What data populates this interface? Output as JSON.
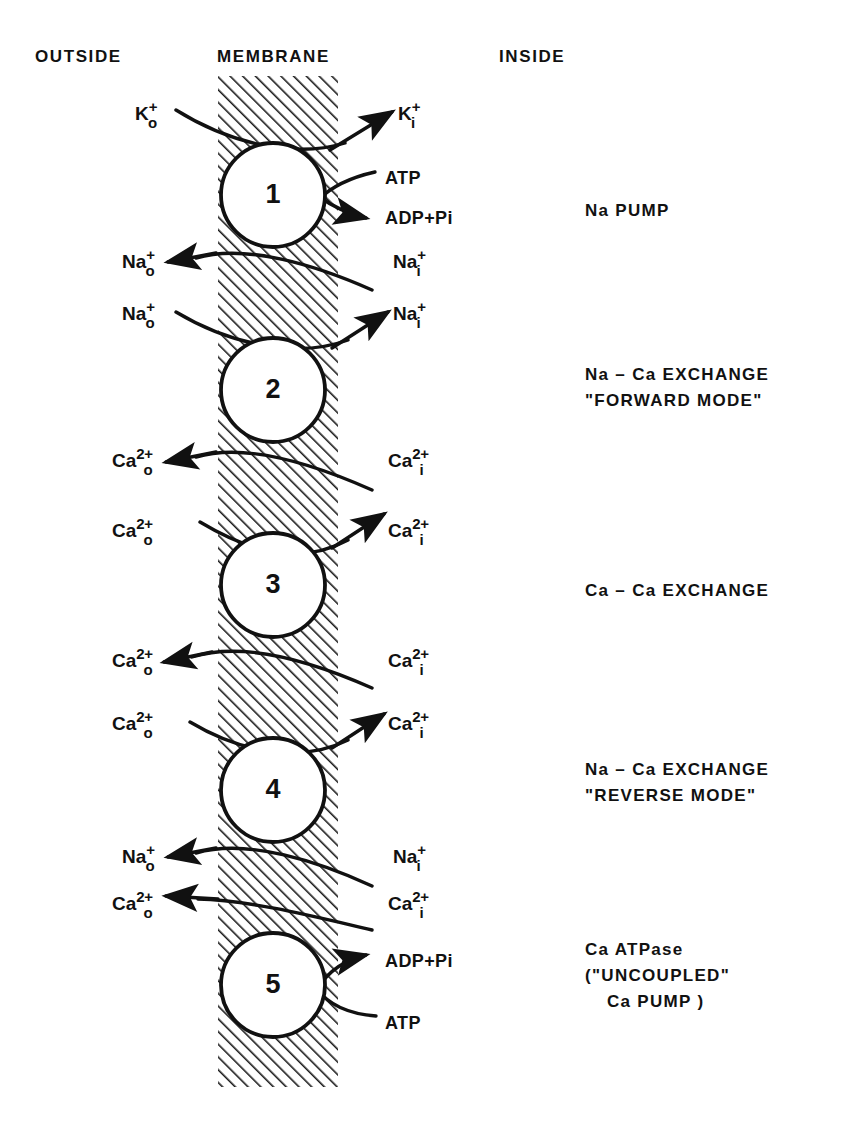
{
  "diagram": {
    "columns": {
      "outside": "OUTSIDE",
      "membrane": "MEMBRANE",
      "inside": "INSIDE"
    },
    "colors": {
      "ink": "#111111",
      "background": "#ffffff",
      "hatch": "#1a1a1a"
    },
    "membrane_band": {
      "x": 218,
      "width": 120,
      "y": 76,
      "height": 1011
    }
  },
  "systems": [
    {
      "number": "1",
      "name_lines": [
        "Na  PUMP"
      ],
      "outside_labels": [
        {
          "base": "K",
          "charge": "+",
          "location": "o"
        },
        {
          "base": "Na",
          "charge": "+",
          "location": "o"
        }
      ],
      "inside_labels": [
        {
          "base": "K",
          "charge": "+",
          "location": "i"
        },
        {
          "base": "Na",
          "charge": "+",
          "location": "i"
        }
      ],
      "molecules": [
        "ATP",
        "ADP+Pi"
      ]
    },
    {
      "number": "2",
      "name_lines": [
        "Na – Ca EXCHANGE",
        "\"FORWARD MODE\""
      ],
      "outside_labels": [
        {
          "base": "Na",
          "charge": "+",
          "location": "o"
        },
        {
          "base": "Ca",
          "charge": "2+",
          "location": "o"
        }
      ],
      "inside_labels": [
        {
          "base": "Na",
          "charge": "+",
          "location": "i"
        },
        {
          "base": "Ca",
          "charge": "2+",
          "location": "i"
        }
      ],
      "molecules": []
    },
    {
      "number": "3",
      "name_lines": [
        "Ca – Ca EXCHANGE"
      ],
      "outside_labels": [
        {
          "base": "Ca",
          "charge": "2+",
          "location": "o"
        },
        {
          "base": "Ca",
          "charge": "2+",
          "location": "o"
        }
      ],
      "inside_labels": [
        {
          "base": "Ca",
          "charge": "2+",
          "location": "i"
        },
        {
          "base": "Ca",
          "charge": "2+",
          "location": "i"
        }
      ],
      "molecules": []
    },
    {
      "number": "4",
      "name_lines": [
        "Na – Ca EXCHANGE",
        "\"REVERSE MODE\""
      ],
      "outside_labels": [
        {
          "base": "Ca",
          "charge": "2+",
          "location": "o"
        },
        {
          "base": "Na",
          "charge": "+",
          "location": "o"
        }
      ],
      "inside_labels": [
        {
          "base": "Ca",
          "charge": "2+",
          "location": "i"
        },
        {
          "base": "Na",
          "charge": "+",
          "location": "i"
        }
      ],
      "molecules": []
    },
    {
      "number": "5",
      "name_lines": [
        "Ca ATPase",
        "(\"UNCOUPLED\"",
        "Ca PUMP )"
      ],
      "outside_labels": [
        {
          "base": "Ca",
          "charge": "2+",
          "location": "o"
        }
      ],
      "inside_labels": [
        {
          "base": "Ca",
          "charge": "2+",
          "location": "i"
        }
      ],
      "molecules": [
        "ADP+Pi",
        "ATP"
      ]
    }
  ],
  "ion_labels_left": [
    {
      "id": "k-out",
      "base": "K",
      "charge": "+",
      "location": "o",
      "x": 135,
      "y": 100
    },
    {
      "id": "na-out-1",
      "base": "Na",
      "charge": "+",
      "location": "o",
      "x": 122,
      "y": 248
    },
    {
      "id": "na-out-2",
      "base": "Na",
      "charge": "+",
      "location": "o",
      "x": 122,
      "y": 300
    },
    {
      "id": "ca-out-1",
      "base": "Ca",
      "charge": "2+",
      "location": "o",
      "x": 112,
      "y": 447
    },
    {
      "id": "ca-out-2",
      "base": "Ca",
      "charge": "2+",
      "location": "o",
      "x": 112,
      "y": 517
    },
    {
      "id": "ca-out-3",
      "base": "Ca",
      "charge": "2+",
      "location": "o",
      "x": 112,
      "y": 647
    },
    {
      "id": "ca-out-4",
      "base": "Ca",
      "charge": "2+",
      "location": "o",
      "x": 112,
      "y": 710
    },
    {
      "id": "na-out-3",
      "base": "Na",
      "charge": "+",
      "location": "o",
      "x": 122,
      "y": 843
    },
    {
      "id": "ca-out-5",
      "base": "Ca",
      "charge": "2+",
      "location": "o",
      "x": 112,
      "y": 890
    }
  ],
  "ion_labels_right": [
    {
      "id": "k-in",
      "base": "K",
      "charge": "+",
      "location": "i",
      "x": 398,
      "y": 100
    },
    {
      "id": "na-in-1",
      "base": "Na",
      "charge": "+",
      "location": "i",
      "x": 393,
      "y": 248
    },
    {
      "id": "na-in-2",
      "base": "Na",
      "charge": "+",
      "location": "i",
      "x": 393,
      "y": 300
    },
    {
      "id": "ca-in-1",
      "base": "Ca",
      "charge": "2+",
      "location": "i",
      "x": 388,
      "y": 447
    },
    {
      "id": "ca-in-2",
      "base": "Ca",
      "charge": "2+",
      "location": "i",
      "x": 388,
      "y": 517
    },
    {
      "id": "ca-in-3",
      "base": "Ca",
      "charge": "2+",
      "location": "i",
      "x": 388,
      "y": 647
    },
    {
      "id": "ca-in-4",
      "base": "Ca",
      "charge": "2+",
      "location": "i",
      "x": 388,
      "y": 710
    },
    {
      "id": "na-in-3",
      "base": "Na",
      "charge": "+",
      "location": "i",
      "x": 393,
      "y": 843
    },
    {
      "id": "ca-in-5",
      "base": "Ca",
      "charge": "2+",
      "location": "i",
      "x": 388,
      "y": 890
    }
  ],
  "molecule_labels": [
    {
      "id": "atp-1",
      "text": "ATP",
      "x": 385,
      "y": 168
    },
    {
      "id": "adp-pi-1",
      "text": "ADP+Pi",
      "x": 385,
      "y": 208
    },
    {
      "id": "adp-pi-5",
      "text": "ADP+Pi",
      "x": 385,
      "y": 951
    },
    {
      "id": "atp-5",
      "text": "ATP",
      "x": 385,
      "y": 1013
    }
  ],
  "system_name_positions": [
    {
      "idx": 0,
      "x": 585,
      "y": 198
    },
    {
      "idx": 1,
      "x": 585,
      "y": 362
    },
    {
      "idx": 2,
      "x": 585,
      "y": 578
    },
    {
      "idx": 3,
      "x": 585,
      "y": 757
    },
    {
      "idx": 4,
      "x": 585,
      "y": 937
    }
  ],
  "circles": [
    {
      "number": "1",
      "cx": 273,
      "cy": 195,
      "r": 52
    },
    {
      "number": "2",
      "cx": 273,
      "cy": 390,
      "r": 52
    },
    {
      "number": "3",
      "cx": 273,
      "cy": 585,
      "r": 52
    },
    {
      "number": "4",
      "cx": 273,
      "cy": 790,
      "r": 52
    },
    {
      "number": "5",
      "cx": 273,
      "cy": 985,
      "r": 52
    }
  ]
}
